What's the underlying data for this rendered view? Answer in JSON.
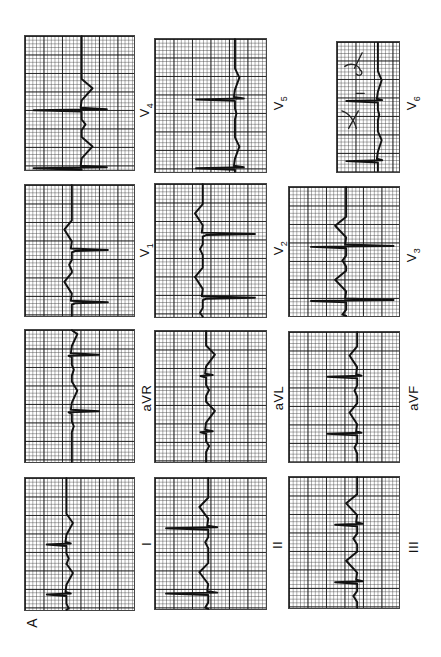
{
  "figure": {
    "letter": "A"
  },
  "grid": {
    "major_px": 18.5,
    "minor_px": 3.7,
    "line_color": "#141414",
    "trace_color": "#111111"
  },
  "leads": [
    {
      "id": "V4",
      "label": "V",
      "sub": "4",
      "x": 24,
      "y": 35,
      "w": 111,
      "h": 136,
      "label_x": 146,
      "label_y": 110,
      "baseline": 0.52,
      "beats": [
        0.55,
        0.985
      ],
      "r": 0.08,
      "s": 0.75,
      "t": 0.62
    },
    {
      "id": "V1",
      "label": "V",
      "sub": "1",
      "x": 24,
      "y": 184,
      "w": 111,
      "h": 133,
      "label_x": 146,
      "label_y": 250,
      "baseline": 0.43,
      "beats": [
        0.5,
        0.9
      ],
      "r": 0.46,
      "s": 0.76,
      "t": 0.36
    },
    {
      "id": "aVR",
      "label": "aVR",
      "sub": "",
      "x": 24,
      "y": 329,
      "w": 111,
      "h": 134,
      "label_x": 146,
      "label_y": 398,
      "baseline": 0.43,
      "beats": [
        0.19,
        0.62
      ],
      "r": 0.4,
      "s": 0.68,
      "t": 0.48
    },
    {
      "id": "I",
      "label": "I",
      "sub": "",
      "x": 24,
      "y": 477,
      "w": 111,
      "h": 134,
      "label_x": 146,
      "label_y": 544,
      "baseline": 0.38,
      "beats": [
        0.5,
        0.88
      ],
      "r": 0.2,
      "s": 0.42,
      "t": 0.44
    },
    {
      "id": "V5",
      "label": "V",
      "sub": "5",
      "x": 154,
      "y": 38,
      "w": 113,
      "h": 135,
      "label_x": 280,
      "label_y": 103,
      "baseline": 0.72,
      "beats": [
        0.45,
        0.97
      ],
      "r": 0.37,
      "s": 0.8,
      "t": 0.76
    },
    {
      "id": "V2",
      "label": "V",
      "sub": "2",
      "x": 154,
      "y": 183,
      "w": 113,
      "h": 135,
      "label_x": 280,
      "label_y": 248,
      "baseline": 0.43,
      "beats": [
        0.38,
        0.86
      ],
      "r": 0.46,
      "s": 0.9,
      "t": 0.36
    },
    {
      "id": "aVL",
      "label": "aVL",
      "sub": "",
      "x": 154,
      "y": 330,
      "w": 113,
      "h": 133,
      "label_x": 278,
      "label_y": 398,
      "baseline": 0.46,
      "beats": [
        0.34,
        0.77
      ],
      "r": 0.41,
      "s": 0.52,
      "t": 0.54
    },
    {
      "id": "II",
      "label": "II",
      "sub": "",
      "x": 154,
      "y": 477,
      "w": 113,
      "h": 133,
      "label_x": 277,
      "label_y": 545,
      "baseline": 0.48,
      "beats": [
        0.38,
        0.88
      ],
      "r": 0.1,
      "s": 0.56,
      "t": 0.4
    },
    {
      "id": "V6",
      "label": "V",
      "sub": "6",
      "x": 336,
      "y": 41,
      "w": 64,
      "h": 132,
      "label_x": 413,
      "label_y": 103,
      "baseline": 0.66,
      "beats": [
        0.45,
        0.92
      ],
      "r": 0.15,
      "s": 0.73,
      "t": 0.72
    },
    {
      "id": "V3",
      "label": "V",
      "sub": "3",
      "x": 288,
      "y": 186,
      "w": 112,
      "h": 131,
      "label_x": 413,
      "label_y": 255,
      "baseline": 0.52,
      "beats": [
        0.46,
        0.88
      ],
      "r": 0.2,
      "s": 0.95,
      "t": 0.42
    },
    {
      "id": "aVF",
      "label": "aVF",
      "sub": "",
      "x": 288,
      "y": 331,
      "w": 112,
      "h": 132,
      "label_x": 413,
      "label_y": 398,
      "baseline": 0.62,
      "beats": [
        0.34,
        0.78
      ],
      "r": 0.35,
      "s": 0.66,
      "t": 0.55
    },
    {
      "id": "III",
      "label": "III",
      "sub": "",
      "x": 288,
      "y": 476,
      "w": 112,
      "h": 133,
      "label_x": 413,
      "label_y": 547,
      "baseline": 0.62,
      "beats": [
        0.36,
        0.8
      ],
      "r": 0.42,
      "s": 0.67,
      "t": 0.52
    }
  ],
  "annotations": {
    "v6_handwriting": "handwritten mark on V6 strip"
  }
}
